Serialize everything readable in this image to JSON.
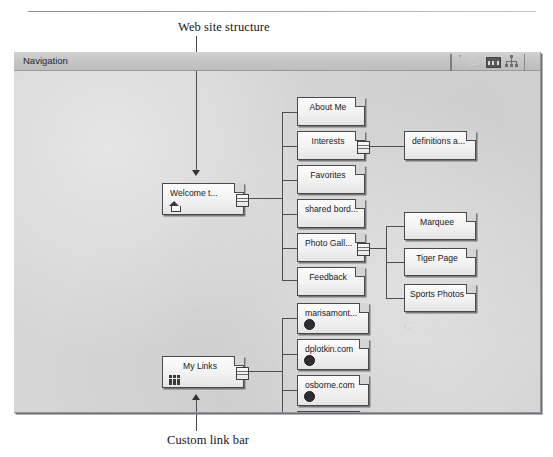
{
  "page": {
    "caption_top": "Web site structure",
    "caption_bottom": "Custom link bar",
    "ghost_text": "C"
  },
  "window": {
    "title": "Navigation",
    "toolbar_icons": [
      {
        "name": "new-page-icon",
        "label": "New Page"
      },
      {
        "name": "globe-icon",
        "label": "Web View"
      },
      {
        "name": "filmstrip-icon",
        "label": "Link Bars"
      },
      {
        "name": "sitemap-icon",
        "label": "Site Structure"
      },
      {
        "name": "page-partial-icon",
        "label": "Page"
      }
    ]
  },
  "tree": {
    "home": {
      "label": "Welcome t...",
      "badge": "home-icon",
      "has_handle": true
    },
    "links_root": {
      "label": "My Links",
      "badge": "link-bar-icon",
      "has_handle": true
    },
    "level2": [
      {
        "label": "About Me",
        "has_handle": false
      },
      {
        "label": "Interests",
        "has_handle": true
      },
      {
        "label": "Favorites",
        "has_handle": false
      },
      {
        "label": "shared bord...",
        "has_handle": false
      },
      {
        "label": "Photo Gall...",
        "has_handle": true
      },
      {
        "label": "Feedback",
        "has_handle": false
      }
    ],
    "interests_children": [
      {
        "label": "definitions a..."
      }
    ],
    "photo_children": [
      {
        "label": "Marquee"
      },
      {
        "label": "Tiger Page"
      },
      {
        "label": "Sports Photos"
      }
    ],
    "custom_links": [
      {
        "label": "marisamont...",
        "badge": "link-dot-icon"
      },
      {
        "label": "dplotkin.com",
        "badge": "link-dot-icon"
      },
      {
        "label": "osborne.com",
        "badge": "link-dot-icon"
      },
      {
        "label": "sfdama.org",
        "badge": "link-dot-icon"
      }
    ]
  }
}
